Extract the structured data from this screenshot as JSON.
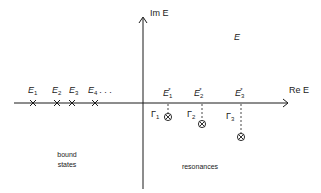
{
  "diagram": {
    "axes": {
      "vertical_label": "Im E",
      "horizontal_label": "Re E",
      "region_label": "E"
    },
    "bound_states": {
      "caption_line1": "bound",
      "caption_line2": "states",
      "points": [
        {
          "symbol": "E",
          "index": "1"
        },
        {
          "symbol": "E",
          "index": "2"
        },
        {
          "symbol": "E",
          "index": "3"
        },
        {
          "symbol": "E",
          "index": "4"
        }
      ],
      "ellipsis": ". . ."
    },
    "resonances": {
      "caption": "resonances",
      "points": [
        {
          "symbol": "E",
          "index": "1",
          "star": "*",
          "width_symbol": "Γ",
          "width_index": "1"
        },
        {
          "symbol": "E",
          "index": "2",
          "star": "*",
          "width_symbol": "Γ",
          "width_index": "2"
        },
        {
          "symbol": "E",
          "index": "3",
          "star": "*",
          "width_symbol": "Γ",
          "width_index": "3"
        }
      ]
    },
    "colors": {
      "ink": "#1a1a1a",
      "background": "#ffffff"
    }
  }
}
